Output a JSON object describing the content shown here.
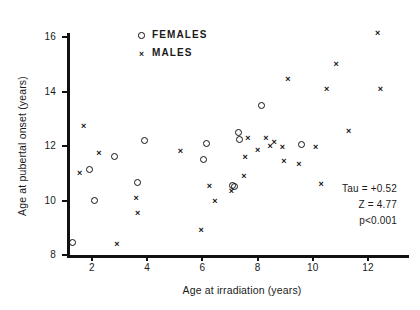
{
  "chart_data": {
    "type": "scatter",
    "title": "",
    "xlabel": "Age at irradiation  (years)",
    "ylabel": "Age at pubertal onset  (years)",
    "xlim": [
      1.0,
      13.5
    ],
    "ylim": [
      8,
      16.6
    ],
    "xticks": [
      2,
      4,
      6,
      8,
      10,
      12
    ],
    "yticks": [
      8,
      10,
      12,
      14,
      16
    ],
    "grid": false,
    "legend_position": "top-center",
    "series": [
      {
        "name": "FEMALES",
        "marker": "open-circle",
        "points": [
          [
            1.3,
            8.45
          ],
          [
            1.9,
            11.15
          ],
          [
            2.1,
            10.0
          ],
          [
            2.8,
            11.6
          ],
          [
            3.65,
            10.65
          ],
          [
            3.9,
            12.2
          ],
          [
            6.05,
            11.5
          ],
          [
            6.15,
            12.1
          ],
          [
            7.1,
            10.55
          ],
          [
            7.15,
            10.5
          ],
          [
            7.3,
            12.5
          ],
          [
            7.35,
            12.25
          ],
          [
            8.15,
            13.5
          ],
          [
            9.6,
            12.05
          ]
        ]
      },
      {
        "name": "MALES",
        "marker": "cross",
        "points": [
          [
            1.55,
            11.0
          ],
          [
            1.7,
            12.75
          ],
          [
            2.25,
            11.75
          ],
          [
            2.9,
            8.4
          ],
          [
            3.6,
            10.1
          ],
          [
            3.65,
            9.55
          ],
          [
            5.2,
            11.8
          ],
          [
            5.95,
            8.9
          ],
          [
            6.25,
            10.55
          ],
          [
            6.45,
            10.0
          ],
          [
            7.05,
            10.35
          ],
          [
            7.5,
            10.9
          ],
          [
            7.55,
            11.6
          ],
          [
            7.65,
            12.3
          ],
          [
            8.0,
            11.85
          ],
          [
            8.3,
            12.3
          ],
          [
            8.45,
            12.0
          ],
          [
            8.6,
            12.15
          ],
          [
            8.9,
            11.95
          ],
          [
            8.95,
            11.45
          ],
          [
            9.1,
            14.45
          ],
          [
            9.5,
            11.35
          ],
          [
            10.1,
            11.95
          ],
          [
            10.3,
            10.6
          ],
          [
            10.5,
            14.1
          ],
          [
            10.85,
            15.0
          ],
          [
            11.3,
            12.55
          ],
          [
            12.35,
            16.15
          ],
          [
            12.45,
            14.1
          ]
        ]
      }
    ],
    "annotations": [
      "Tau = +0.52",
      "Z = 4.77",
      "p<0.001"
    ]
  },
  "axis": {
    "x_tick_labels": [
      "2",
      "4",
      "6",
      "8",
      "10",
      "12"
    ],
    "y_tick_labels": [
      "8",
      "10",
      "12",
      "14",
      "16"
    ]
  },
  "legend": {
    "items": [
      {
        "label": "FEMALES",
        "marker": "open-circle"
      },
      {
        "label": "MALES",
        "marker": "cross"
      }
    ]
  }
}
